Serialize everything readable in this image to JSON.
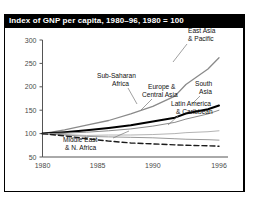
{
  "title": "Index of GNP per capita, 1980–96, 1980 = 100",
  "chart_data": {
    "type": "line",
    "title": "Index of GNP per capita, 1980–96, 1980 = 100",
    "xlabel": "",
    "ylabel": "",
    "x": [
      1980,
      1982,
      1984,
      1986,
      1988,
      1990,
      1992,
      1994,
      1996
    ],
    "xlim": [
      1980,
      1996
    ],
    "ylim": [
      50,
      300
    ],
    "xticks": [
      "1980",
      "1985",
      "1990",
      "1996"
    ],
    "xtick_values": [
      1980,
      1985,
      1990,
      1996
    ],
    "yticks": [
      "50",
      "100",
      "150",
      "200",
      "250",
      "300"
    ],
    "ytick_values": [
      50,
      100,
      150,
      200,
      250,
      300
    ],
    "grid": false,
    "legend": "annotations",
    "series": [
      {
        "name": "East Asia & Pacific",
        "values": [
          100,
          108,
          118,
          128,
          142,
          158,
          180,
          205,
          238,
          262
        ],
        "x": [
          1980,
          1982,
          1984,
          1986,
          1988,
          1990,
          1992,
          1993,
          1995,
          1996
        ],
        "style": "solid",
        "color": "#8a8a8a",
        "width": 1.3
      },
      {
        "name": "South Asia",
        "values": [
          100,
          103,
          107,
          112,
          118,
          126,
          134,
          143,
          152,
          160
        ],
        "x": [
          1980,
          1982,
          1984,
          1986,
          1988,
          1990,
          1992,
          1993,
          1995,
          1996
        ],
        "style": "solid",
        "color": "#000000",
        "width": 2.0
      },
      {
        "name": "Europe & Central Asia",
        "values": [
          100,
          101,
          103,
          106,
          110,
          116,
          124,
          131,
          142,
          150
        ],
        "x": [
          1980,
          1982,
          1984,
          1986,
          1988,
          1990,
          1992,
          1993,
          1995,
          1996
        ],
        "style": "solid",
        "color": "#8a8a8a",
        "width": 1.0
      },
      {
        "name": "Latin America & Caribbean",
        "values": [
          100,
          98,
          96,
          97,
          97,
          98,
          100,
          102,
          104,
          106
        ],
        "x": [
          1980,
          1982,
          1984,
          1986,
          1988,
          1990,
          1992,
          1993,
          1995,
          1996
        ],
        "style": "solid",
        "color": "#b4b4b4",
        "width": 1.0
      },
      {
        "name": "Sub-Saharan Africa",
        "values": [
          100,
          97,
          94,
          93,
          92,
          91,
          89,
          88,
          87,
          86
        ],
        "x": [
          1980,
          1982,
          1984,
          1986,
          1988,
          1990,
          1992,
          1993,
          1995,
          1996
        ],
        "style": "solid",
        "color": "#9a9a9a",
        "width": 1.0
      },
      {
        "name": "Middle East & N. Africa",
        "values": [
          100,
          95,
          89,
          84,
          80,
          78,
          76,
          75,
          74,
          73
        ],
        "x": [
          1980,
          1982,
          1984,
          1986,
          1988,
          1990,
          1992,
          1993,
          1995,
          1996
        ],
        "style": "dashed",
        "color": "#1a1a1a",
        "width": 1.4
      }
    ],
    "annotations": [
      {
        "text_lines": [
          "East Asia",
          "& Pacific"
        ],
        "name": "east-asia-pacific"
      },
      {
        "text_lines": [
          "Sub-Saharan",
          "Africa"
        ],
        "name": "sub-saharan-africa"
      },
      {
        "text_lines": [
          "Europe &",
          "Central Asia"
        ],
        "name": "europe-central-asia"
      },
      {
        "text_lines": [
          "South",
          "Asia"
        ],
        "name": "south-asia"
      },
      {
        "text_lines": [
          "Latin America",
          "& Caribbean"
        ],
        "name": "latin-america-caribbean"
      },
      {
        "text_lines": [
          "Middle East",
          "& N. Africa"
        ],
        "name": "middle-east-n-africa"
      }
    ]
  },
  "axis": {
    "y": {
      "t300": "300",
      "t250": "250",
      "t200": "200",
      "t150": "150",
      "t100": "100",
      "t50": "50"
    },
    "x": {
      "t1980": "1980",
      "t1985": "1985",
      "t1990": "1990",
      "t1996": "1996"
    }
  },
  "labels": {
    "east_asia_1": "East Asia",
    "east_asia_2": "& Pacific",
    "subsaharan_1": "Sub-Saharan",
    "subsaharan_2": "Africa",
    "europe_1": "Europe &",
    "europe_2": "Central Asia",
    "south_asia_1": "South",
    "south_asia_2": "Asia",
    "latam_1": "Latin America",
    "latam_2": "& Caribbean",
    "mena_1": "Middle East",
    "mena_2": "& N. Africa"
  }
}
